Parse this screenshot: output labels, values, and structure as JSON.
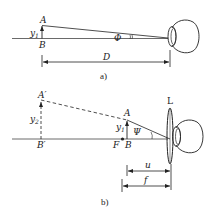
{
  "diagram_a": {
    "caption": "a)",
    "labels": {
      "top_point": "A",
      "base_point": "B",
      "object_height": "y",
      "object_height_sub": "1",
      "angle": "Φ",
      "distance": "D"
    }
  },
  "diagram_b": {
    "caption": "b)",
    "labels": {
      "image_top": "A′",
      "image_base": "B′",
      "image_height": "y",
      "image_height_sub": "2",
      "object_top": "A",
      "object_base": "B",
      "object_height": "y",
      "object_height_sub": "1",
      "focal_point": "F",
      "angle": "Ψ",
      "lens": "L",
      "object_distance": "u",
      "focal_length": "f"
    }
  },
  "colors": {
    "stroke": "#222222",
    "background": "#ffffff"
  }
}
